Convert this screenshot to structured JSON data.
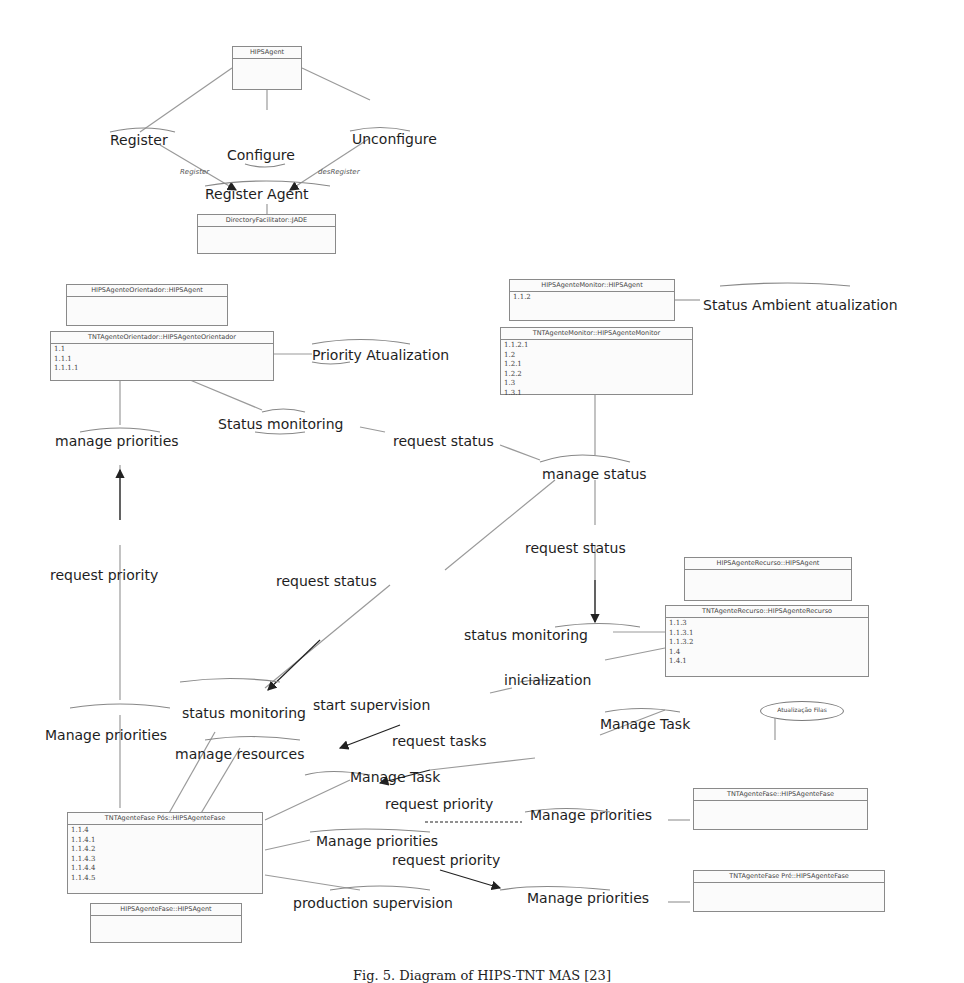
{
  "diagram": {
    "classes": {
      "hips_agent": {
        "title": "HIPSAgent",
        "items": []
      },
      "directory_facilitator": {
        "title": "DirectoryFacilitator::JADE",
        "items": []
      },
      "orientador_base": {
        "title": "HIPSAgenteOrientador::HIPSAgent",
        "items": []
      },
      "orientador_tnt": {
        "title": "TNTAgenteOrientador::HIPSAgenteOrientador",
        "items": [
          "1.1",
          "1.1.1",
          "1.1.1.1"
        ]
      },
      "monitor_base": {
        "title": "HIPSAgenteMonitor::HIPSAgent",
        "items": [
          "1.1.2"
        ]
      },
      "monitor_tnt": {
        "title": "TNTAgenteMonitor::HIPSAgenteMonitor",
        "items": [
          "1.1.2.1",
          "1.2",
          "1.2.1",
          "1.2.2",
          "1.3",
          "1.3.1"
        ]
      },
      "recurso_base": {
        "title": "HIPSAgenteRecurso::HIPSAgent",
        "items": []
      },
      "recurso_tnt": {
        "title": "TNTAgenteRecurso::HIPSAgenteRecurso",
        "items": [
          "1.1.3",
          "1.1.3.1",
          "1.1.3.2",
          "1.4",
          "1.4.1"
        ]
      },
      "fase_pos": {
        "title": "TNTAgenteFase Pós::HIPSAgenteFase",
        "items": [
          "1.1.4",
          "1.1.4.1",
          "1.1.4.2",
          "1.1.4.3",
          "1.1.4.4",
          "1.1.4.5"
        ]
      },
      "fase_base": {
        "title": "HIPSAgenteFase::HIPSAgent",
        "items": []
      },
      "fase_tnt": {
        "title": "TNTAgenteFase::HIPSAgenteFase",
        "items": []
      },
      "fase_pre": {
        "title": "TNTAgenteFase Pré::HIPSAgenteFase",
        "items": []
      }
    },
    "usecase_ellipse": {
      "label": "Atualização Filas"
    },
    "labels": {
      "register": "Register",
      "configure": "Configure",
      "unconfigure": "Unconfigure",
      "register_small": "Register",
      "desregister_small": "desRegister",
      "register_agent": "Register Agent",
      "priority_atualization": "Priority Atualization",
      "status_ambient_atualization": "Status Ambient atualization",
      "status_monitoring_top": "Status monitoring",
      "manage_priorities_top": "manage priorities",
      "request_status_top": "request status",
      "manage_status": "manage status",
      "request_status_mid": "request status",
      "request_priority_left": "request priority",
      "request_status_diag": "request status",
      "status_monitoring_right": "status monitoring",
      "inicialization": "inicialization",
      "status_monitoring_left": "status monitoring",
      "start_supervision": "start supervision",
      "manage_task_right": "Manage Task",
      "manage_priorities_left": "Manage priorities",
      "manage_resources": "manage resources",
      "request_tasks": "request tasks",
      "manage_task_left": "Manage Task",
      "request_priority_1": "request priority",
      "manage_priorities_r1": "Manage priorities",
      "manage_priorities_mid": "Manage priorities",
      "request_priority_2": "request priority",
      "manage_priorities_r2": "Manage priorities",
      "production_supervision": "production supervision"
    },
    "caption": "Fig. 5. Diagram of HIPS-TNT MAS [23]"
  }
}
